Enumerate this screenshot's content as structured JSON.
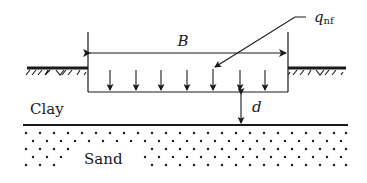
{
  "diagram": {
    "labels": {
      "width": "B",
      "load": "q",
      "load_subscript": "nf",
      "depth": "d",
      "upper_layer": "Clay",
      "lower_layer": "Sand"
    },
    "colors": {
      "ink": "#1a1a1a",
      "background": "#ffffff"
    },
    "load_arrow_count": 7
  }
}
